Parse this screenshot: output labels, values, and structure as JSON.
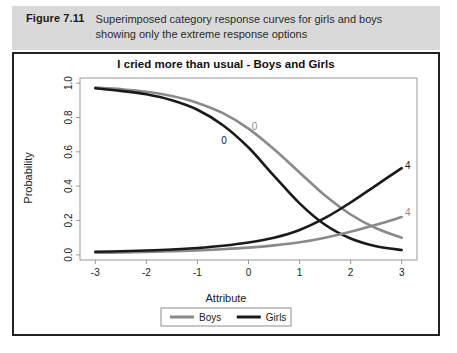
{
  "caption": {
    "figure_label": "Figure 7.11",
    "line1": "Superimposed category response curves for girls and boys",
    "line2": "showing only the extreme response options"
  },
  "chart_data": {
    "type": "line",
    "title": "I cried more than usual - Boys and Girls",
    "xlabel": "Attribute",
    "ylabel": "Probability",
    "xlim": [
      -3.3,
      3.3
    ],
    "ylim": [
      -0.03,
      1.03
    ],
    "xticks": [
      -3,
      -2,
      -1,
      0,
      1,
      2,
      3
    ],
    "xtick_labels": [
      "-3",
      "-2",
      "-1",
      "0",
      "1",
      "2",
      "3"
    ],
    "yticks": [
      0.0,
      0.2,
      0.4,
      0.6,
      0.8,
      1.0
    ],
    "ytick_labels": [
      "0.0",
      "0.2",
      "0.4",
      "0.6",
      "0.8",
      "1.0"
    ],
    "grid": false,
    "legend_position": "bottom",
    "colors": {
      "boys": "#8a8a8a",
      "girls": "#1a1a1a"
    },
    "x": [
      -3.0,
      -2.5,
      -2.0,
      -1.5,
      -1.0,
      -0.5,
      0.0,
      0.5,
      1.0,
      1.5,
      2.0,
      2.5,
      3.0
    ],
    "series": [
      {
        "name": "Boys",
        "category": "0",
        "color": "#8a8a8a",
        "label_text": "0",
        "label_x": 0.12,
        "label_y": 0.73,
        "values": [
          0.975,
          0.965,
          0.95,
          0.925,
          0.885,
          0.825,
          0.735,
          0.615,
          0.48,
          0.345,
          0.235,
          0.155,
          0.1
        ]
      },
      {
        "name": "Girls",
        "category": "0",
        "color": "#1a1a1a",
        "label_text": "0",
        "label_x": -0.48,
        "label_y": 0.645,
        "values": [
          0.97,
          0.955,
          0.935,
          0.9,
          0.845,
          0.755,
          0.625,
          0.46,
          0.3,
          0.175,
          0.095,
          0.05,
          0.028
        ]
      },
      {
        "name": "Boys",
        "category": "4",
        "color": "#8a8a8a",
        "label_text": "4",
        "label_x": 3.12,
        "label_y": 0.225,
        "values": [
          0.012,
          0.014,
          0.017,
          0.021,
          0.026,
          0.033,
          0.042,
          0.055,
          0.073,
          0.1,
          0.135,
          0.175,
          0.22
        ]
      },
      {
        "name": "Girls",
        "category": "4",
        "color": "#1a1a1a",
        "label_text": "4",
        "label_x": 3.12,
        "label_y": 0.5,
        "values": [
          0.018,
          0.021,
          0.025,
          0.031,
          0.04,
          0.053,
          0.072,
          0.1,
          0.145,
          0.215,
          0.305,
          0.405,
          0.505
        ]
      }
    ],
    "legend": [
      {
        "label": "Boys",
        "color": "#8a8a8a"
      },
      {
        "label": "Girls",
        "color": "#1a1a1a"
      }
    ]
  }
}
